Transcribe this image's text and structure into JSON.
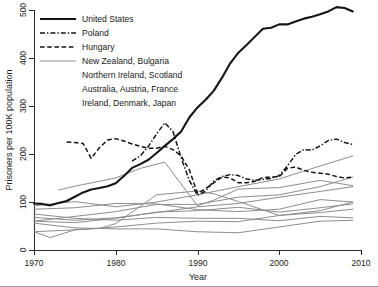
{
  "chart_data": {
    "type": "line",
    "title": "",
    "xlabel": "Year",
    "ylabel": "Prisoners per 100K population",
    "xlim": [
      1970,
      2010
    ],
    "ylim": [
      0,
      500
    ],
    "xticks": [
      1970,
      1980,
      1990,
      2000,
      2010
    ],
    "yticks": [
      0,
      100,
      200,
      300,
      400,
      500
    ],
    "grid": false,
    "legend_position": "upper-left",
    "legend_entries": [
      {
        "label": "United States",
        "style": "solid-thick-black"
      },
      {
        "label": "Poland",
        "style": "dash-dot-black"
      },
      {
        "label": "Hungary",
        "style": "dashed-black"
      },
      {
        "label": "New Zealand, Bulgaria",
        "style": "solid-thin-gray"
      },
      {
        "label": "Northern Ireland, Scotland",
        "style": "continuation"
      },
      {
        "label": "Australia, Austria, France",
        "style": "continuation"
      },
      {
        "label": "Ireland, Denmark, Japan",
        "style": "continuation"
      }
    ],
    "series": [
      {
        "name": "United States",
        "style": "solid-thick-black",
        "x": [
          1970,
          1971,
          1972,
          1973,
          1974,
          1975,
          1976,
          1977,
          1978,
          1979,
          1980,
          1981,
          1982,
          1983,
          1984,
          1985,
          1986,
          1987,
          1988,
          1989,
          1990,
          1991,
          1992,
          1993,
          1994,
          1995,
          1996,
          1997,
          1998,
          1999,
          2000,
          2001,
          2002,
          2003,
          2004,
          2005,
          2006,
          2007,
          2008,
          2009
        ],
        "y": [
          97,
          96,
          93,
          98,
          102,
          111,
          120,
          126,
          129,
          133,
          139,
          154,
          171,
          179,
          188,
          202,
          217,
          231,
          247,
          276,
          297,
          313,
          332,
          359,
          389,
          411,
          427,
          444,
          461,
          463,
          470,
          470,
          476,
          482,
          486,
          491,
          497,
          506,
          504,
          497
        ]
      },
      {
        "name": "Poland",
        "style": "dash-dot-black",
        "x": [
          1982,
          1983,
          1984,
          1985,
          1986,
          1987,
          1988,
          1989,
          1990,
          1991,
          1992,
          1993,
          1994,
          1995,
          1996,
          1997,
          1998,
          1999,
          2000,
          2001,
          2002,
          2003,
          2004,
          2005,
          2006,
          2007,
          2008,
          2009
        ],
        "y": [
          185,
          196,
          216,
          242,
          265,
          247,
          192,
          145,
          114,
          123,
          144,
          153,
          157,
          155,
          148,
          145,
          147,
          149,
          155,
          175,
          199,
          209,
          208,
          217,
          228,
          231,
          224,
          220
        ]
      },
      {
        "name": "Hungary",
        "style": "dashed-black",
        "x": [
          1974,
          1975,
          1976,
          1977,
          1978,
          1979,
          1980,
          1981,
          1982,
          1983,
          1984,
          1985,
          1986,
          1987,
          1988,
          1989,
          1990,
          1991,
          1992,
          1993,
          1994,
          1995,
          1996,
          1997,
          1998,
          1999,
          2000,
          2001,
          2002,
          2003,
          2004,
          2005,
          2006,
          2007,
          2008,
          2009
        ],
        "y": [
          225,
          224,
          222,
          191,
          213,
          229,
          232,
          227,
          221,
          216,
          212,
          212,
          216,
          209,
          196,
          167,
          118,
          128,
          140,
          152,
          150,
          140,
          140,
          143,
          151,
          152,
          153,
          170,
          173,
          166,
          162,
          160,
          158,
          153,
          150,
          152
        ]
      },
      {
        "name": "New Zealand",
        "style": "solid-thin-gray",
        "x": [
          1970,
          1975,
          1980,
          1985,
          1990,
          1995,
          2000,
          2005,
          2009
        ],
        "y": [
          92,
          101,
          90,
          100,
          115,
          132,
          148,
          175,
          196
        ]
      },
      {
        "name": "Bulgaria",
        "style": "solid-thin-gray",
        "x": [
          1973,
          1975,
          1980,
          1983,
          1986,
          1990,
          1992,
          1995,
          2000,
          2005,
          2009
        ],
        "y": [
          125,
          133,
          150,
          170,
          183,
          92,
          104,
          127,
          130,
          145,
          134
        ]
      },
      {
        "name": "Northern Ireland",
        "style": "solid-thin-gray",
        "x": [
          1970,
          1972,
          1975,
          1978,
          1980,
          1985,
          1990,
          1992,
          1995,
          2000,
          2005,
          2009
        ],
        "y": [
          38,
          26,
          42,
          45,
          55,
          115,
          123,
          117,
          101,
          72,
          82,
          100
        ]
      },
      {
        "name": "Scotland",
        "style": "solid-thin-gray",
        "x": [
          1970,
          1975,
          1980,
          1985,
          1990,
          1995,
          2000,
          2005,
          2009
        ],
        "y": [
          60,
          70,
          80,
          95,
          95,
          110,
          115,
          132,
          152
        ]
      },
      {
        "name": "Australia",
        "style": "solid-thin-gray",
        "x": [
          1970,
          1975,
          1980,
          1985,
          1990,
          1995,
          2000,
          2005,
          2009
        ],
        "y": [
          68,
          62,
          67,
          78,
          90,
          97,
          110,
          122,
          132
        ]
      },
      {
        "name": "Austria",
        "style": "solid-thin-gray",
        "x": [
          1970,
          1975,
          1980,
          1985,
          1990,
          1995,
          2000,
          2005,
          2009
        ],
        "y": [
          85,
          88,
          97,
          96,
          84,
          80,
          85,
          105,
          100
        ]
      },
      {
        "name": "France",
        "style": "solid-thin-gray",
        "x": [
          1970,
          1975,
          1980,
          1985,
          1990,
          1995,
          2000,
          2005,
          2009
        ],
        "y": [
          60,
          57,
          66,
          79,
          82,
          89,
          79,
          88,
          96
        ]
      },
      {
        "name": "Ireland",
        "style": "solid-thin-gray",
        "x": [
          1970,
          1975,
          1980,
          1985,
          1990,
          1995,
          2000,
          2005,
          2009
        ],
        "y": [
          38,
          42,
          48,
          56,
          60,
          59,
          72,
          78,
          85
        ]
      },
      {
        "name": "Denmark",
        "style": "solid-thin-gray",
        "x": [
          1970,
          1975,
          1980,
          1985,
          1990,
          1995,
          2000,
          2005,
          2009
        ],
        "y": [
          75,
          66,
          62,
          68,
          66,
          66,
          61,
          70,
          67
        ]
      },
      {
        "name": "Japan",
        "style": "solid-thin-gray",
        "x": [
          1970,
          1975,
          1980,
          1985,
          1990,
          1995,
          2000,
          2005,
          2009
        ],
        "y": [
          56,
          46,
          44,
          44,
          38,
          36,
          48,
          60,
          62
        ]
      }
    ]
  },
  "axes": {
    "x_tick_labels": [
      "1970",
      "1980",
      "1990",
      "2000",
      "2010"
    ],
    "y_tick_labels": [
      "0",
      "100",
      "200",
      "300",
      "400",
      "500"
    ],
    "x_axis_title": "Year",
    "y_axis_title": "Prisoners per 100K population"
  },
  "legend": {
    "items": [
      {
        "label": "United States"
      },
      {
        "label": "Poland"
      },
      {
        "label": "Hungary"
      },
      {
        "label": "New Zealand, Bulgaria"
      },
      {
        "label": "Northern Ireland, Scotland"
      },
      {
        "label": "Australia, Austria, France"
      },
      {
        "label": "Ireland, Denmark, Japan"
      }
    ]
  },
  "colors": {
    "highlight": "#151515",
    "other_series": "#8d8d8d",
    "axis": "#2b2b2b",
    "background": "#ffffff"
  }
}
